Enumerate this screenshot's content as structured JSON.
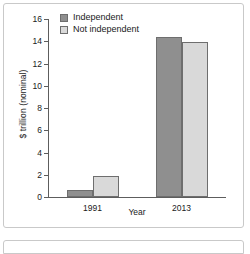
{
  "chart_data": {
    "type": "bar",
    "title": "",
    "subtitle": "",
    "categories": [
      "1991",
      "2013"
    ],
    "series": [
      {
        "name": "Independent",
        "values": [
          0.65,
          14.4
        ],
        "color": "#8f8f8f"
      },
      {
        "name": "Not independent",
        "values": [
          1.85,
          13.9
        ],
        "color": "#d9d9d9"
      }
    ],
    "xlabel": "Year",
    "ylabel": "$ trillion (nominal)",
    "ylim": [
      0,
      16
    ],
    "ytick_step": 2,
    "yticks": [
      "16",
      "14",
      "12",
      "10",
      "8",
      "6",
      "4",
      "2",
      "0"
    ],
    "grid": false,
    "legend_position": "upper left",
    "axis_color": "#5d5d5d",
    "bar_edge_color": "#6e6e6e",
    "text_color": "#1a1a1a",
    "frame_color": "#c9c9c9",
    "background": "#ffffff"
  },
  "legend": {
    "entries": [
      {
        "label": "Independent"
      },
      {
        "label": "Not independent"
      }
    ]
  },
  "axes": {
    "ylabel": "$ trillion (nominal)",
    "xlabel": "Year"
  }
}
